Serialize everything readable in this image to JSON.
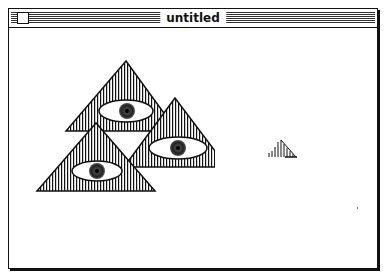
{
  "window": {
    "title": "untitled",
    "close_box": "close-box"
  },
  "canvas": {
    "shapes": [
      {
        "type": "pyramid-with-eye",
        "label": "top pyramid"
      },
      {
        "type": "pyramid-with-eye",
        "label": "right pyramid"
      },
      {
        "type": "pyramid-with-eye",
        "label": "bottom pyramid"
      },
      {
        "type": "small-pyramid-sketch",
        "label": "small hatched shape"
      }
    ],
    "colors": {
      "ink": "#111111",
      "paper": "#ffffff"
    }
  }
}
